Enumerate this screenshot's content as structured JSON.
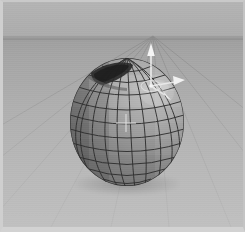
{
  "viewport": {
    "name": "3d-viewport",
    "width": 245,
    "height": 232,
    "background_color": "#b0b0b0",
    "label": "3D Viewport"
  },
  "ground": {
    "name": "grid-floor",
    "label": "Grid Floor",
    "horizon_y": 34,
    "line_color": "#8c8c8c",
    "near_color": "#c0c0c0",
    "far_color": "#9e9e9e"
  },
  "sky": {
    "name": "background-sky",
    "label": "Background",
    "color": "#b2b2b2"
  },
  "object": {
    "name": "uv-sphere",
    "label": "Sphere",
    "type": "UV Sphere",
    "center_x": 124,
    "center_y": 120,
    "radius_x": 58,
    "radius_y": 65,
    "wireframe": true,
    "segments": 16,
    "rings": 12,
    "fill_light": "#b9b9b9",
    "fill_dark": "#7f7f7f",
    "wire_color": "#2d2d2d",
    "selection_notch": "top-left-faces-removed"
  },
  "gizmo": {
    "name": "transform-gizmo",
    "label": "Move Gizmo",
    "color": "#f2f2f2",
    "origin_x": 148,
    "origin_y": 84,
    "axes": [
      {
        "name": "gizmo-axis-y",
        "label": "Y",
        "direction": "up"
      },
      {
        "name": "gizmo-axis-x",
        "label": "X",
        "direction": "right"
      },
      {
        "name": "gizmo-axis-z",
        "label": "Z",
        "direction": "down-right"
      }
    ],
    "handle_ring": true
  },
  "crosshair": {
    "name": "pivot-crosshair",
    "label": "3D Cursor",
    "x": 122,
    "y": 120,
    "color": "#e0e0e0"
  },
  "shadow": {
    "name": "contact-shadow",
    "label": "Shadow"
  }
}
